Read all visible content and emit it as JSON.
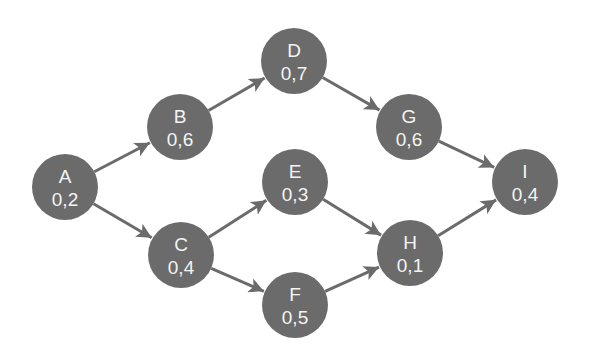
{
  "colors": {
    "background": "#ffffff",
    "node_fill": "#6b6b6b",
    "node_text": "#f4f4f4",
    "edge": "#6b6b6b"
  },
  "diagram": {
    "node_radius": 33,
    "nodes": [
      {
        "id": "A",
        "name": "A",
        "value": "0,2",
        "x": 65,
        "y": 187
      },
      {
        "id": "B",
        "name": "B",
        "value": "0,6",
        "x": 180,
        "y": 127
      },
      {
        "id": "C",
        "name": "C",
        "value": "0,4",
        "x": 181,
        "y": 255
      },
      {
        "id": "D",
        "name": "D",
        "value": "0,7",
        "x": 294,
        "y": 61
      },
      {
        "id": "E",
        "name": "E",
        "value": "0,3",
        "x": 295,
        "y": 182
      },
      {
        "id": "F",
        "name": "F",
        "value": "0,5",
        "x": 295,
        "y": 305
      },
      {
        "id": "G",
        "name": "G",
        "value": "0,6",
        "x": 409,
        "y": 127
      },
      {
        "id": "H",
        "name": "H",
        "value": "0,1",
        "x": 410,
        "y": 253
      },
      {
        "id": "I",
        "name": "I",
        "value": "0,4",
        "x": 525,
        "y": 182
      }
    ],
    "edges": [
      {
        "from": "A",
        "to": "B"
      },
      {
        "from": "A",
        "to": "C"
      },
      {
        "from": "B",
        "to": "D"
      },
      {
        "from": "D",
        "to": "G"
      },
      {
        "from": "G",
        "to": "I"
      },
      {
        "from": "C",
        "to": "E"
      },
      {
        "from": "C",
        "to": "F"
      },
      {
        "from": "E",
        "to": "H"
      },
      {
        "from": "F",
        "to": "H"
      },
      {
        "from": "H",
        "to": "I"
      }
    ]
  }
}
